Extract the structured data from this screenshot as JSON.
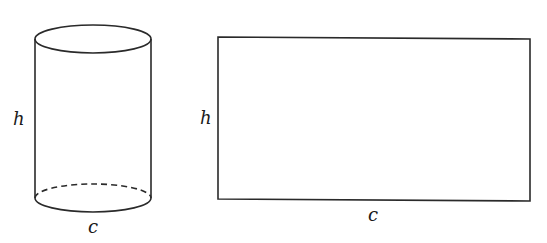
{
  "diagram": {
    "stroke_color": "#2a2a2a",
    "background": "#ffffff",
    "cylinder": {
      "height_label": "h",
      "circumference_label": "c",
      "hidden_edge_style": "dashed"
    },
    "rectangle": {
      "height_label": "h",
      "width_label": "c"
    }
  }
}
